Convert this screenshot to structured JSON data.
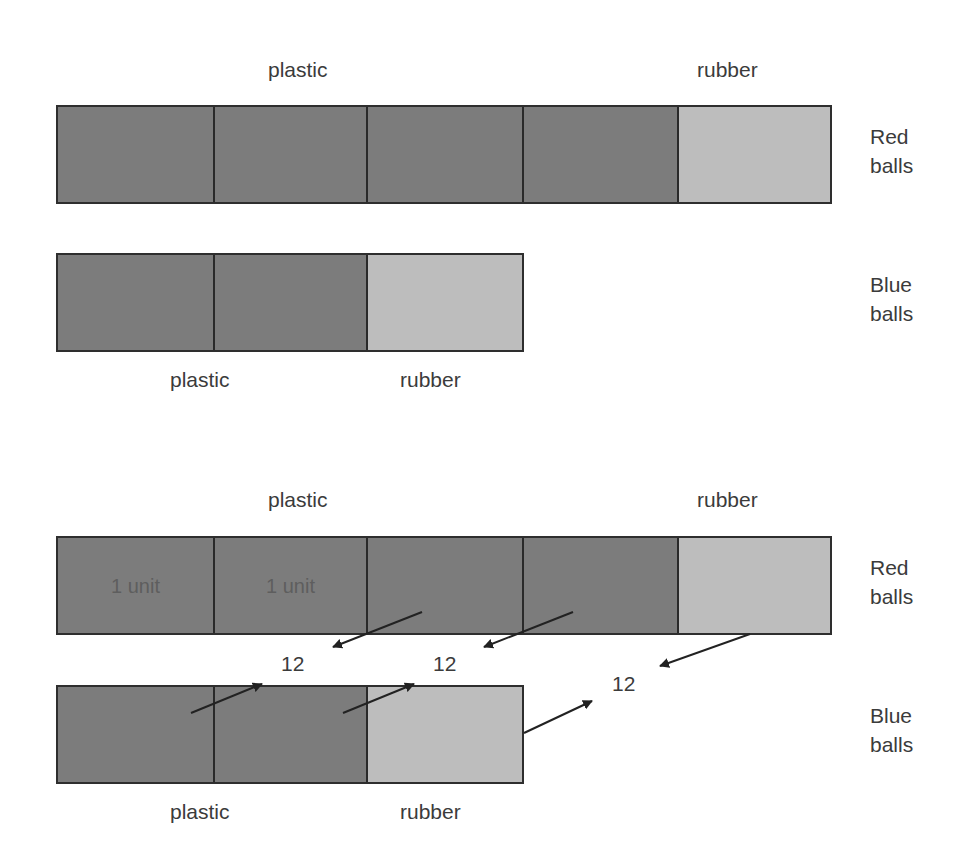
{
  "diagrams": [
    {
      "name": "before",
      "red": {
        "top_labels": {
          "plastic": "plastic",
          "rubber": "rubber"
        },
        "side_label": [
          "Red",
          "balls"
        ],
        "segments": [
          {
            "type": "plastic",
            "text": ""
          },
          {
            "type": "plastic",
            "text": ""
          },
          {
            "type": "plastic",
            "text": ""
          },
          {
            "type": "plastic",
            "text": ""
          },
          {
            "type": "rubber",
            "text": ""
          }
        ]
      },
      "blue": {
        "bottom_labels": {
          "plastic": "plastic",
          "rubber": "rubber"
        },
        "side_label": [
          "Blue",
          "balls"
        ],
        "segments": [
          {
            "type": "plastic",
            "text": ""
          },
          {
            "type": "plastic",
            "text": ""
          },
          {
            "type": "rubber",
            "text": ""
          }
        ]
      }
    },
    {
      "name": "after",
      "red": {
        "top_labels": {
          "plastic": "plastic",
          "rubber": "rubber"
        },
        "side_label": [
          "Red",
          "balls"
        ],
        "segments": [
          {
            "type": "plastic",
            "text": "1 unit"
          },
          {
            "type": "plastic",
            "text": "1 unit"
          },
          {
            "type": "plastic",
            "text": ""
          },
          {
            "type": "plastic",
            "text": ""
          },
          {
            "type": "rubber",
            "text": ""
          }
        ]
      },
      "blue": {
        "bottom_labels": {
          "plastic": "plastic",
          "rubber": "rubber"
        },
        "side_label": [
          "Blue",
          "balls"
        ],
        "segments": [
          {
            "type": "plastic",
            "text": ""
          },
          {
            "type": "plastic",
            "text": ""
          },
          {
            "type": "rubber",
            "text": ""
          }
        ]
      },
      "transfers": [
        "12",
        "12",
        "12"
      ]
    }
  ],
  "colors": {
    "plastic_fill": "#7c7c7c",
    "rubber_fill": "#bdbdbd",
    "outline": "#2e2e2e",
    "arrow": "#222222"
  }
}
